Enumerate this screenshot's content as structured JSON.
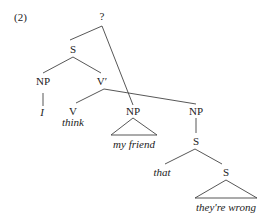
{
  "example_number": "(2)",
  "tree": {
    "root": "?",
    "nodes": {
      "s_main": "S",
      "np_subject": "NP",
      "subject_word": "I",
      "v_bar": "V′",
      "v": "V",
      "verb_word": "think",
      "np_object": "NP",
      "object_phrase": "my friend",
      "np_clause": "NP",
      "s_clause": "S",
      "complementizer": "that",
      "s_embedded": "S",
      "embedded_phrase": "they're wrong"
    }
  },
  "colors": {
    "line": "#444444",
    "text": "#222222",
    "background": "#ffffff"
  }
}
